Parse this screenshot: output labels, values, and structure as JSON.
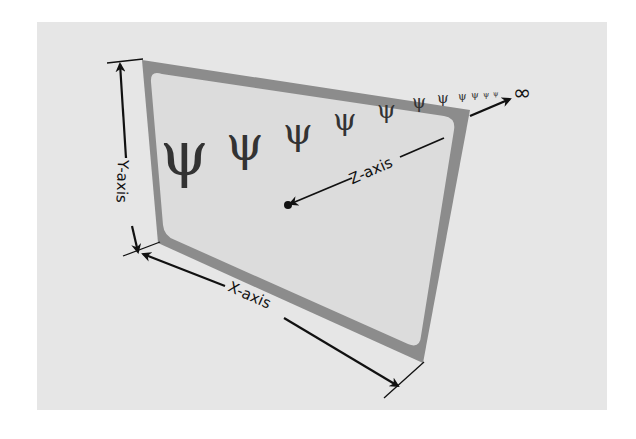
{
  "diagram": {
    "labels": {
      "y_axis": "Y-axis",
      "x_axis": "X-axis",
      "z_axis": "Z-axis",
      "infinity": "∞"
    },
    "colors": {
      "background_panel": "#e6e6e6",
      "frame": "#8c8c8c",
      "screen": "#dcdcdc",
      "ink": "#111111",
      "cactus": "#333333"
    },
    "cactus_glyph": "ψ",
    "cactus_count": 11
  }
}
